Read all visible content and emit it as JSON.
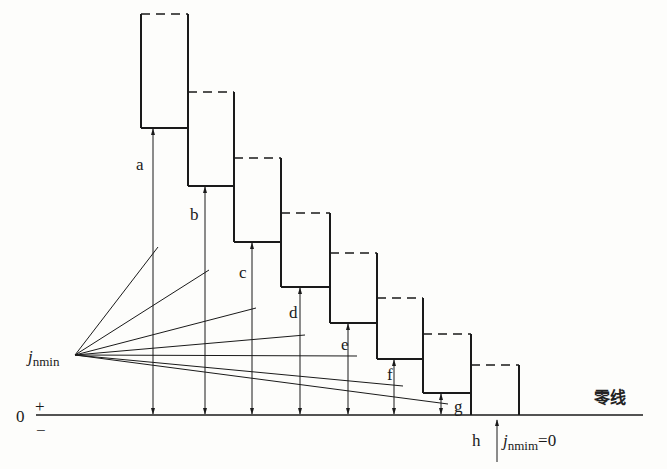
{
  "zero_line_label": "零线",
  "axis": {
    "zero": "0",
    "plus": "+",
    "minus": "−"
  },
  "origin_label": {
    "main": "j",
    "sub": "nmin"
  },
  "h_note": {
    "main": "j",
    "sub": "nmim",
    "suffix": "=0"
  },
  "deviations": [
    {
      "label": "a",
      "rank": 8
    },
    {
      "label": "b",
      "rank": 7
    },
    {
      "label": "c",
      "rank": 6
    },
    {
      "label": "d",
      "rank": 5
    },
    {
      "label": "e",
      "rank": 4
    },
    {
      "label": "f",
      "rank": 3
    },
    {
      "label": "g",
      "rank": 2
    },
    {
      "label": "h",
      "rank": 1
    }
  ]
}
